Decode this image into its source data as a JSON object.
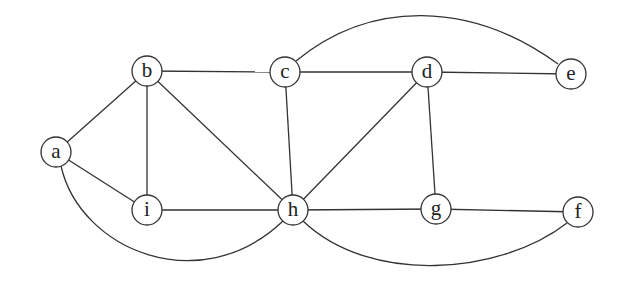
{
  "diagram": {
    "type": "undirected-graph",
    "node_radius": 15,
    "colors": {
      "stroke": "#333333",
      "fill": "#ffffff",
      "label": "#222222"
    },
    "nodes": [
      {
        "id": "a",
        "label": "a",
        "x": 56,
        "y": 152
      },
      {
        "id": "b",
        "label": "b",
        "x": 147,
        "y": 71
      },
      {
        "id": "c",
        "label": "c",
        "x": 285,
        "y": 72
      },
      {
        "id": "d",
        "label": "d",
        "x": 427,
        "y": 72
      },
      {
        "id": "e",
        "label": "e",
        "x": 571,
        "y": 74
      },
      {
        "id": "f",
        "label": "f",
        "x": 578,
        "y": 212
      },
      {
        "id": "g",
        "label": "g",
        "x": 436,
        "y": 209
      },
      {
        "id": "h",
        "label": "h",
        "x": 293,
        "y": 210
      },
      {
        "id": "i",
        "label": "i",
        "x": 147,
        "y": 210
      }
    ],
    "edges": [
      {
        "from": "a",
        "to": "b",
        "kind": "line"
      },
      {
        "from": "a",
        "to": "i",
        "kind": "line"
      },
      {
        "from": "a",
        "to": "h",
        "kind": "arc",
        "path": "M 61 166 C 80 250, 200 300, 283 221"
      },
      {
        "from": "b",
        "to": "c",
        "kind": "line"
      },
      {
        "from": "b",
        "to": "i",
        "kind": "line"
      },
      {
        "from": "b",
        "to": "h",
        "kind": "line"
      },
      {
        "from": "c",
        "to": "d",
        "kind": "line"
      },
      {
        "from": "c",
        "to": "h",
        "kind": "line"
      },
      {
        "from": "c",
        "to": "e",
        "kind": "arc",
        "path": "M 296 61 C 370 0, 470 0, 558 64"
      },
      {
        "from": "d",
        "to": "e",
        "kind": "line"
      },
      {
        "from": "d",
        "to": "h",
        "kind": "line"
      },
      {
        "from": "d",
        "to": "g",
        "kind": "line"
      },
      {
        "from": "h",
        "to": "i",
        "kind": "line"
      },
      {
        "from": "h",
        "to": "g",
        "kind": "line"
      },
      {
        "from": "h",
        "to": "f",
        "kind": "arc",
        "path": "M 303 221 C 370 285, 500 275, 567 223"
      },
      {
        "from": "g",
        "to": "f",
        "kind": "line"
      }
    ]
  }
}
